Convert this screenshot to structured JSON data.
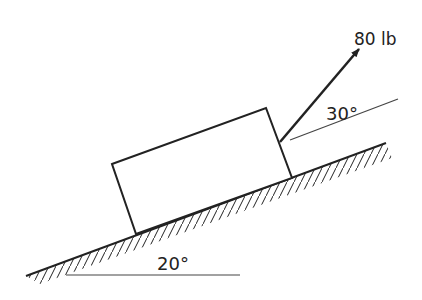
{
  "diagram": {
    "type": "free-body incline",
    "force": {
      "label": "80 lb",
      "angle_label": "30°"
    },
    "incline": {
      "angle_label": "20°"
    },
    "colors": {
      "ink": "#222222",
      "background": "#ffffff"
    }
  }
}
